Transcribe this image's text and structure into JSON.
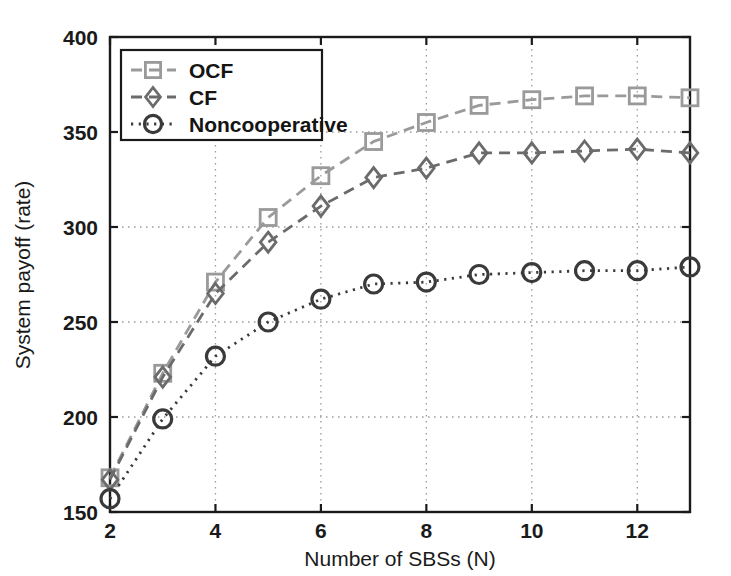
{
  "chart_data": {
    "type": "line",
    "title": "",
    "xlabel": "Number of SBSs (N)",
    "ylabel": "System payoff (rate)",
    "xlim": [
      2,
      13
    ],
    "ylim": [
      150,
      400
    ],
    "xticks": [
      2,
      4,
      6,
      8,
      10,
      12
    ],
    "yticks": [
      150,
      200,
      250,
      300,
      350,
      400
    ],
    "xtick_labels": [
      "2",
      "4",
      "6",
      "8",
      "10",
      "12"
    ],
    "ytick_labels": [
      "150",
      "200",
      "250",
      "300",
      "350",
      "400"
    ],
    "grid": true,
    "grid_style": "dotted",
    "legend_position": "upper left",
    "x": [
      2,
      3,
      4,
      5,
      6,
      7,
      8,
      9,
      10,
      11,
      12,
      13
    ],
    "series": [
      {
        "name": "OCF",
        "marker": "square",
        "linestyle": "dashed",
        "color": "#9a9a9a",
        "values": [
          168,
          223,
          271,
          305,
          327,
          345,
          355,
          364,
          367,
          369,
          369,
          368
        ]
      },
      {
        "name": "CF",
        "marker": "diamond",
        "linestyle": "dashed",
        "color": "#6b6b6b",
        "values": [
          167,
          221,
          265,
          292,
          311,
          326,
          331,
          339,
          339,
          340,
          341,
          339
        ]
      },
      {
        "name": "Noncooperative",
        "marker": "circle",
        "linestyle": "dotted",
        "color": "#3a3a3a",
        "values": [
          157,
          199,
          232,
          250,
          262,
          270,
          271,
          275,
          276,
          277,
          277,
          279
        ]
      }
    ]
  },
  "legend": {
    "entries": [
      {
        "label": "OCF"
      },
      {
        "label": "CF"
      },
      {
        "label": "Noncooperative"
      }
    ]
  },
  "axes": {
    "x_title": "Number of SBSs (N)",
    "y_title": "System payoff (rate)"
  },
  "colors": {
    "axis": "#1a1a1a",
    "grid": "#9a9a9a",
    "ocf": "#9a9a9a",
    "cf": "#6b6b6b",
    "noncooperative": "#3a3a3a",
    "background": "#ffffff"
  }
}
